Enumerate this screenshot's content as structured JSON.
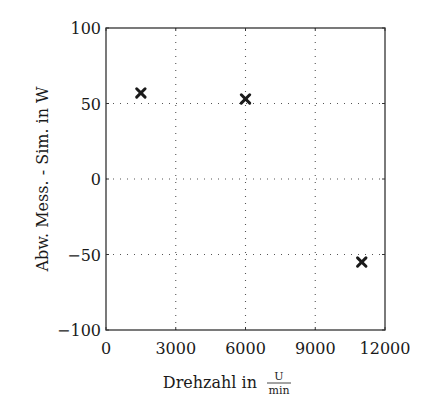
{
  "chart_data": {
    "type": "scatter",
    "title": "",
    "xlabel": "Drehzahl in",
    "xlabel_unit": {
      "numerator": "U",
      "denominator": "min"
    },
    "ylabel": "Abw. Mess. - Sim. in W",
    "xlim": [
      0,
      12000
    ],
    "ylim": [
      -100,
      100
    ],
    "xticks": [
      0,
      3000,
      6000,
      9000,
      12000
    ],
    "xtick_labels": [
      "0",
      "3000",
      "6000",
      "9000",
      "12000"
    ],
    "yticks": [
      -100,
      -50,
      0,
      50,
      100
    ],
    "ytick_labels": [
      "−100",
      "−50",
      "0",
      "50",
      "100"
    ],
    "grid": true,
    "grid_style": "dotted",
    "marker": "x",
    "series": [
      {
        "name": "Abweichung",
        "x": [
          1500,
          6000,
          11000
        ],
        "y": [
          57,
          53,
          -55
        ]
      }
    ],
    "legend": null
  },
  "colors": {
    "axes": "#333333",
    "grid": "#555555",
    "marker": "#1a1a1a",
    "background": "#ffffff"
  }
}
